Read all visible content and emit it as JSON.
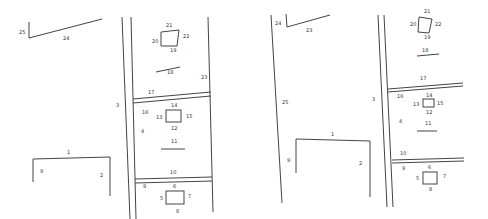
{
  "panels": [
    {
      "id": "left",
      "labels": {
        "l1": "1",
        "l2": "2",
        "l3": "3",
        "l4": "4",
        "l5": "5",
        "l6": "6",
        "l7": "7",
        "l8": "8",
        "l9": "9",
        "l10": "10",
        "l11": "11",
        "l12": "12",
        "l13": "13",
        "l14": "14",
        "l15": "15",
        "l16": "16",
        "l17": "17",
        "l18": "18",
        "l19": "19",
        "l20": "20",
        "l21": "21",
        "l22": "22",
        "l23": "23",
        "l24": "24",
        "l25": "25"
      }
    },
    {
      "id": "right",
      "labels": {
        "l1": "1",
        "l2": "2",
        "l3": "3",
        "l4": "4",
        "l5": "5",
        "l6": "6",
        "l7": "7",
        "l8": "8",
        "l9": "9",
        "l10": "10",
        "l11": "11",
        "l12": "12",
        "l13": "13",
        "l14": "14",
        "l15": "15",
        "l16": "16",
        "l17": "17",
        "l18": "18",
        "l19": "19",
        "l20": "20",
        "l21": "21",
        "l22": "22",
        "l23": "23",
        "l24": "24",
        "l25": "25"
      }
    }
  ],
  "colors": {
    "line": "#444444",
    "text": "#333333",
    "background": "#ffffff"
  }
}
